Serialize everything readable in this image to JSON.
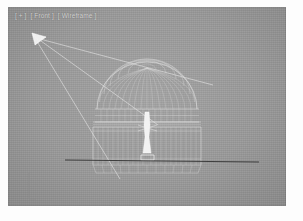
{
  "app": {
    "kind": "3d-modeling-viewport",
    "background_color": "#9a9a9a",
    "wire_color": "#e6e6e6",
    "ground_color": "#2e2e2e"
  },
  "viewport": {
    "label_segments": [
      "[ + ]",
      "[ Front ]",
      "[ Wireframe ]"
    ],
    "label_full": "[ + ] [ Front ] [ Wireframe ]",
    "view_name": "Front",
    "shading_mode": "Wireframe",
    "menu_marker": "+"
  },
  "scene": {
    "title": "Domed conservatory wireframe",
    "objects": [
      {
        "name": "camera-gizmo",
        "label": "Camera",
        "type": "camera",
        "x": 35,
        "y": 33
      },
      {
        "name": "view-cone",
        "label": "View cone",
        "type": "cone"
      },
      {
        "name": "dome",
        "label": "Glass dome",
        "type": "dome-mesh",
        "meridians": 17,
        "latitudes": 7
      },
      {
        "name": "clerestory",
        "label": "Clerestory band",
        "type": "band",
        "panels": 18
      },
      {
        "name": "colonnade",
        "label": "Colonnade",
        "type": "columns",
        "columns": 22
      },
      {
        "name": "central-statue",
        "label": "Central statue",
        "type": "figure"
      },
      {
        "name": "base-plinth",
        "label": "Base plinth",
        "type": "grid"
      },
      {
        "name": "ground-line",
        "label": "Ground plane",
        "type": "line"
      },
      {
        "name": "axis-tripod",
        "label": "Axis tripod",
        "type": "axis"
      }
    ]
  }
}
